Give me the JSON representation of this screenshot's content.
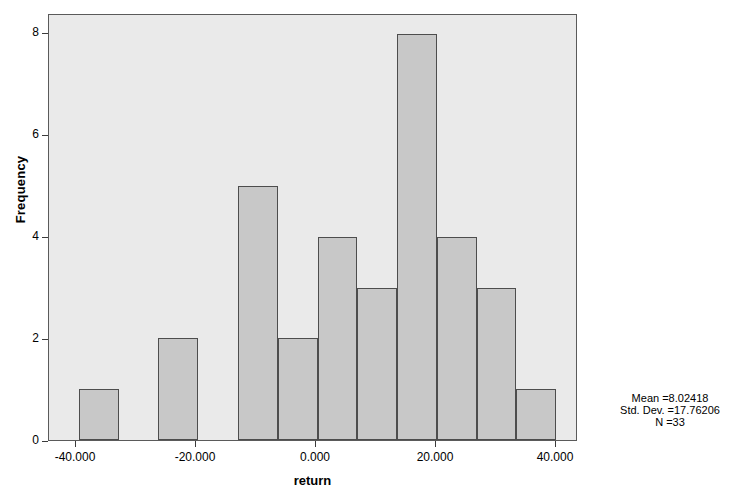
{
  "chart_data": {
    "type": "bar",
    "title": "",
    "subtitle": "",
    "xlabel": "return",
    "ylabel": "Frequency",
    "xlim": [
      -45,
      43.3
    ],
    "ylim": [
      0,
      8.37
    ],
    "grid": false,
    "legend": null,
    "bin_width": 6.667,
    "x_ticks": [
      "-40.000",
      "-20.000",
      "0.000",
      "20.000",
      "40.000"
    ],
    "x_tick_values": [
      -40,
      -20,
      0,
      20,
      40
    ],
    "y_ticks": [
      "0",
      "2",
      "4",
      "6",
      "8"
    ],
    "y_tick_values": [
      0,
      2,
      4,
      6,
      8
    ],
    "bins": [
      {
        "left": -40.0,
        "right": -33.33,
        "value": 1
      },
      {
        "left": -33.33,
        "right": -26.67,
        "value": 0
      },
      {
        "left": -26.67,
        "right": -20.0,
        "value": 2
      },
      {
        "left": -20.0,
        "right": -13.33,
        "value": 0
      },
      {
        "left": -13.33,
        "right": -6.67,
        "value": 5
      },
      {
        "left": -6.67,
        "right": 0.0,
        "value": 2
      },
      {
        "left": 0.0,
        "right": 6.67,
        "value": 4
      },
      {
        "left": 6.67,
        "right": 13.33,
        "value": 3
      },
      {
        "left": 13.33,
        "right": 20.0,
        "value": 8
      },
      {
        "left": 20.0,
        "right": 26.67,
        "value": 4
      },
      {
        "left": 26.67,
        "right": 33.33,
        "value": 3
      },
      {
        "left": 33.33,
        "right": 40.0,
        "value": 1
      }
    ],
    "values": [
      1,
      0,
      2,
      0,
      5,
      2,
      4,
      3,
      8,
      4,
      3,
      1
    ],
    "categories": [
      "-40.0",
      "-33.3",
      "-26.7",
      "-20.0",
      "-13.3",
      "-6.7",
      "0.0",
      "6.7",
      "13.3",
      "20.0",
      "26.7",
      "33.3"
    ],
    "annotations": {
      "mean": "Mean =8.02418",
      "std_dev": "Std. Dev. =17.76206",
      "n": "N =33"
    },
    "colors": {
      "bar_fill": "#c8c8c8",
      "bar_border": "#4d4d4d",
      "plot_background": "#eaeaea",
      "frame": "#5a5a5a",
      "text": "#000000"
    }
  }
}
